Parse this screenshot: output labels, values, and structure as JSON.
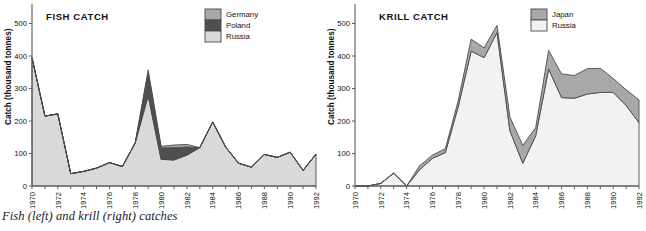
{
  "caption": "Fish (left) and krill (right) catches",
  "colors": {
    "germany": "#a8a8a8",
    "poland": "#4f4f4f",
    "russia_fish": "#d9d9d9",
    "japan": "#a8a8a8",
    "russia_krill": "#f2f2f2",
    "outline": "#4a4a4a",
    "axis": "#5a5a5a",
    "text": "#111111"
  },
  "panels": {
    "fish": {
      "title": "FISH  CATCH",
      "ylabel": "Catch (thousand tonnes)",
      "legend": [
        {
          "label": "Germany",
          "color": "#a8a8a8"
        },
        {
          "label": "Poland",
          "color": "#4f4f4f"
        },
        {
          "label": "Russia",
          "color": "#d9d9d9"
        }
      ],
      "yticks": [
        "0",
        "100",
        "200",
        "300",
        "400",
        "500"
      ],
      "xticks": [
        "1970",
        "1972",
        "1974",
        "1976",
        "1978",
        "1980",
        "1982",
        "1984",
        "1986",
        "1988",
        "1990",
        "1992"
      ]
    },
    "krill": {
      "title": "KRILL  CATCH",
      "ylabel": "Catch (thousand tonnes)",
      "legend": [
        {
          "label": "Japan",
          "color": "#a8a8a8"
        },
        {
          "label": "Russia",
          "color": "#f2f2f2"
        }
      ],
      "yticks": [
        "0",
        "100",
        "200",
        "300",
        "400",
        "500"
      ],
      "xticks": [
        "1970",
        "1972",
        "1974",
        "1976",
        "1978",
        "1980",
        "1982",
        "1984",
        "1986",
        "1988",
        "1990",
        "1992"
      ]
    }
  },
  "chart_data": [
    {
      "type": "area",
      "id": "fish-catch",
      "title": "FISH  CATCH",
      "xlabel": "",
      "ylabel": "Catch (thousand tonnes)",
      "stacked": true,
      "ylim": [
        0,
        560
      ],
      "xlim": [
        1970,
        1992
      ],
      "grid": false,
      "legend_position": "top-right",
      "x": [
        1970,
        1971,
        1972,
        1973,
        1974,
        1975,
        1976,
        1977,
        1978,
        1979,
        1980,
        1981,
        1982,
        1983,
        1984,
        1985,
        1986,
        1987,
        1988,
        1989,
        1990,
        1991,
        1992
      ],
      "series": [
        {
          "name": "Russia",
          "color": "#d9d9d9",
          "values": [
            395,
            215,
            222,
            38,
            45,
            55,
            72,
            60,
            133,
            278,
            82,
            80,
            95,
            118,
            197,
            120,
            70,
            58,
            97,
            88,
            104,
            48,
            98
          ]
        },
        {
          "name": "Poland",
          "color": "#4f4f4f",
          "values": [
            0,
            0,
            0,
            0,
            0,
            0,
            0,
            0,
            0,
            70,
            35,
            38,
            25,
            0,
            0,
            0,
            0,
            0,
            0,
            0,
            0,
            0,
            0
          ]
        },
        {
          "name": "Germany",
          "color": "#a8a8a8",
          "values": [
            0,
            0,
            0,
            0,
            0,
            0,
            0,
            0,
            0,
            9,
            5,
            8,
            8,
            0,
            0,
            0,
            0,
            0,
            0,
            0,
            0,
            0,
            0
          ]
        }
      ],
      "totals": [
        395,
        215,
        222,
        38,
        45,
        55,
        72,
        60,
        133,
        357,
        122,
        126,
        128,
        118,
        197,
        120,
        70,
        58,
        97,
        88,
        104,
        48,
        98
      ]
    },
    {
      "type": "area",
      "id": "krill-catch",
      "title": "KRILL  CATCH",
      "xlabel": "",
      "ylabel": "Catch (thousand tonnes)",
      "stacked": true,
      "ylim": [
        0,
        560
      ],
      "xlim": [
        1970,
        1992
      ],
      "grid": false,
      "legend_position": "top-right",
      "x": [
        1970,
        1971,
        1972,
        1973,
        1974,
        1975,
        1976,
        1977,
        1978,
        1979,
        1980,
        1981,
        1982,
        1983,
        1984,
        1985,
        1986,
        1987,
        1988,
        1989,
        1990,
        1991,
        1992
      ],
      "series": [
        {
          "name": "Russia",
          "color": "#f2f2f2",
          "values": [
            0,
            0,
            8,
            40,
            0,
            50,
            85,
            103,
            245,
            415,
            395,
            472,
            170,
            70,
            155,
            360,
            272,
            270,
            283,
            288,
            288,
            248,
            195
          ]
        },
        {
          "name": "Japan",
          "color": "#a8a8a8",
          "values": [
            0,
            0,
            0,
            0,
            0,
            12,
            10,
            12,
            18,
            37,
            30,
            22,
            42,
            55,
            25,
            57,
            73,
            70,
            78,
            74,
            43,
            48,
            70
          ]
        }
      ],
      "totals": [
        0,
        0,
        8,
        40,
        0,
        62,
        95,
        115,
        263,
        452,
        425,
        494,
        212,
        125,
        180,
        417,
        345,
        340,
        361,
        362,
        331,
        296,
        265
      ]
    }
  ]
}
